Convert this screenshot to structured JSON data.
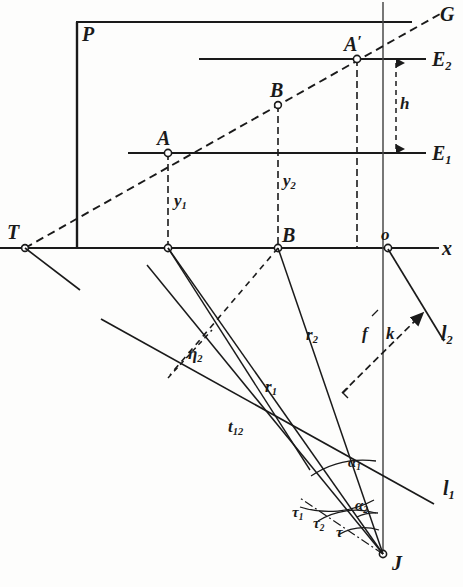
{
  "figure": {
    "background_color": "#fdfdfc",
    "ink_color": "#1a1a1a"
  },
  "labels": {
    "plane_P": "P",
    "point_T": "T",
    "point_A": "A",
    "point_A_prime_base": "A",
    "point_A_prime_mark": "′",
    "point_B_upper": "B",
    "point_B_lower": "B",
    "line_G": "G",
    "plane_E2_base": "E",
    "plane_E2_sub": "2",
    "plane_E1_base": "E",
    "plane_E1_sub": "1",
    "height_h": "h",
    "ordinate_y1_base": "y",
    "ordinate_y1_sub": "1",
    "ordinate_y2_base": "y",
    "ordinate_y2_sub": "2",
    "origin_o": "o",
    "axis_x": "x",
    "radius_r1_base": "r",
    "radius_r1_sub": "1",
    "radius_r2_base": "r",
    "radius_r2_sub": "2",
    "tangent_tn_base": "t",
    "tangent_tn_sub": "12",
    "eta2_base": "η",
    "eta2_sub": "2",
    "focal_f": "f",
    "segment_k": "k",
    "line_l1_base": "l",
    "line_l1_sub": "1",
    "line_l2_base": "l",
    "line_l2_sub": "2",
    "angle_alpha1_base": "α",
    "angle_alpha1_sub": "1",
    "angle_alpha2_base": "α",
    "angle_alpha2_sub": "2",
    "angle_tau1_base": "τ",
    "angle_tau1_sub": "1",
    "angle_tau2_base": "τ",
    "angle_tau2_sub": "2",
    "angle_tau": "τ",
    "point_J": "J"
  },
  "geometry": {
    "points": {
      "T": {
        "x": 25,
        "y": 248
      },
      "A": {
        "x": 168,
        "y": 153
      },
      "A_prime": {
        "x": 357,
        "y": 59
      },
      "B_upper": {
        "x": 278,
        "y": 105
      },
      "A_foot": {
        "x": 168,
        "y": 248
      },
      "B_foot": {
        "x": 278,
        "y": 248
      },
      "Ap_foot": {
        "x": 357,
        "y": 248
      },
      "origin_o": {
        "x": 388,
        "y": 248
      },
      "J": {
        "x": 383,
        "y": 555
      },
      "k_end": {
        "x": 418,
        "y": 317
      },
      "k_start": {
        "x": 344,
        "y": 392
      },
      "eta_foot": {
        "x": 170,
        "y": 375
      },
      "eta_top": {
        "x": 205,
        "y": 333
      }
    },
    "axis_x": {
      "x1": 0,
      "y1": 248,
      "x2": 432,
      "y2": 248,
      "label_x": 441,
      "label_y": 240
    },
    "vertical_axis": {
      "x": 383,
      "y1": 2,
      "y2": 555
    },
    "plane_P_rect": {
      "x1": 76,
      "y1": 22,
      "x2": 412,
      "y2": 248
    },
    "line_E2": {
      "x1": 199,
      "y1": 59,
      "x2": 425,
      "y2": 59
    },
    "line_E1": {
      "x1": 128,
      "y1": 153,
      "x2": 425,
      "y2": 153
    },
    "line_G": {
      "x1": 25,
      "y1": 248,
      "x2": 438,
      "y2": 14
    },
    "line_l1": {
      "x1": 103,
      "y1": 320,
      "x2": 432,
      "y2": 503
    },
    "line_l2": {
      "x1": 388,
      "y1": 248,
      "x2": 443,
      "y2": 340
    },
    "height_arrow": {
      "x": 396,
      "y1": 59,
      "y2": 153
    }
  },
  "annotation_notes": {
    "dashed_elements": [
      "line G",
      "y1 ordinate",
      "y2 ordinate",
      "A' ordinate",
      "h arrow",
      "segment k",
      "eta2 perpendicular",
      "T-to-B_foot ray"
    ],
    "solid_elements": [
      "plane P outline",
      "E1",
      "E2",
      "x axis",
      "vertical axis f",
      "r1",
      "r2",
      "t12",
      "l1",
      "l2",
      "angle arcs"
    ]
  }
}
